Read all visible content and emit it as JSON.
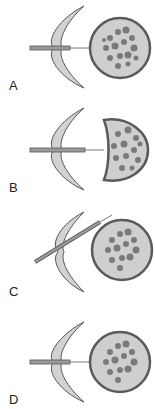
{
  "figure": {
    "panels": [
      {
        "id": "A",
        "label": "A",
        "state": "pipette approaching cell"
      },
      {
        "id": "B",
        "label": "B",
        "state": "cell aspirated into pipette"
      },
      {
        "id": "C",
        "label": "C",
        "state": "pipette angled"
      },
      {
        "id": "D",
        "label": "D",
        "state": "pipette withdrawn"
      }
    ]
  },
  "colors": {
    "membrane_fill": "#d2d2d2",
    "membrane_stroke": "#555555",
    "cell_fill": "#cfcfcf",
    "cell_stroke": "#5a5a5a",
    "granule": "#7a7a7a",
    "pipette": "#8c8c8c"
  }
}
